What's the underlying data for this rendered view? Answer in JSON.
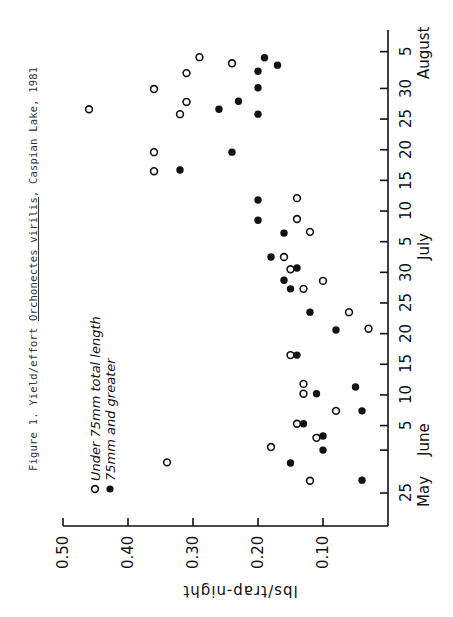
{
  "figure": {
    "title_prefix": "Figure 1.  Yield/effort ",
    "title_species": "Orchonectes virilis",
    "title_suffix": ", Caspian Lake, 1981"
  },
  "legend": {
    "open_label": "Under 75mm total length",
    "filled_label": "75mm and greater"
  },
  "axes": {
    "value_axis_title": "lbs/trap-night",
    "value_ticks": [
      "0.50",
      "0.40",
      "0.30",
      "0.20",
      "0.10"
    ],
    "date_tick_labels": [
      "25",
      "5",
      "10",
      "15",
      "20",
      "25",
      "30",
      "5",
      "10",
      "15",
      "20",
      "25",
      "30",
      "5"
    ],
    "month_labels": [
      "May",
      "June",
      "July",
      "August"
    ]
  },
  "chart_data": {
    "type": "scatter",
    "title": "Figure 1. Yield/effort Orchonectes virilis, Caspian Lake, 1981",
    "orientation": "rotated 90° counter-clockwise (date axis vertical on right, value axis horizontal at bottom)",
    "xlabel": "Date (May 25 – August 5, 1981)",
    "ylabel": "lbs/trap-night",
    "ylim": [
      0,
      0.5
    ],
    "y_ticks": [
      0.1,
      0.2,
      0.3,
      0.4,
      0.5
    ],
    "x_ticks": [
      "May 25",
      "Jun 1",
      "Jun 5",
      "Jun 10",
      "Jun 15",
      "Jun 20",
      "Jun 25",
      "Jun 30",
      "Jul 5",
      "Jul 10",
      "Jul 15",
      "Jul 20",
      "Jul 25",
      "Jul 30",
      "Aug 5"
    ],
    "grid": false,
    "legend_position": "upper-left (rotated)",
    "series": [
      {
        "name": "Under 75mm total length",
        "marker": "open-circle",
        "points": [
          {
            "date": "May 27",
            "day": 2,
            "value": 0.12
          },
          {
            "date": "May 30",
            "day": 5,
            "value": 0.34
          },
          {
            "date": "Jun 1",
            "day": 7.5,
            "value": 0.18
          },
          {
            "date": "Jun 3",
            "day": 9,
            "value": 0.11
          },
          {
            "date": "Jun 5",
            "day": 11.3,
            "value": 0.14
          },
          {
            "date": "Jun 8",
            "day": 13.4,
            "value": 0.08
          },
          {
            "date": "Jun 11",
            "day": 16.2,
            "value": 0.13
          },
          {
            "date": "Jun 12",
            "day": 17.8,
            "value": 0.13
          },
          {
            "date": "Jun 17",
            "day": 22.5,
            "value": 0.15
          },
          {
            "date": "Jun 21",
            "day": 26.8,
            "value": 0.03
          },
          {
            "date": "Jun 24",
            "day": 29.5,
            "value": 0.06
          },
          {
            "date": "Jun 28",
            "day": 33.3,
            "value": 0.13
          },
          {
            "date": "Jun 29",
            "day": 34.6,
            "value": 0.1
          },
          {
            "date": "Jul 1",
            "day": 36.5,
            "value": 0.15
          },
          {
            "date": "Jul 3",
            "day": 38.5,
            "value": 0.16
          },
          {
            "date": "Jul 7",
            "day": 42.6,
            "value": 0.12
          },
          {
            "date": "Jul 9",
            "day": 44.7,
            "value": 0.14
          },
          {
            "date": "Jul 12",
            "day": 48.1,
            "value": 0.14
          },
          {
            "date": "Jul 17",
            "day": 52.5,
            "value": 0.36
          },
          {
            "date": "Jul 20",
            "day": 55.6,
            "value": 0.36
          },
          {
            "date": "Jul 26",
            "day": 61.8,
            "value": 0.32
          },
          {
            "date": "Jul 27",
            "day": 62.6,
            "value": 0.46
          },
          {
            "date": "Jul 28",
            "day": 63.8,
            "value": 0.31
          },
          {
            "date": "Jul 30",
            "day": 65.9,
            "value": 0.36
          },
          {
            "date": "Aug 1",
            "day": 68.5,
            "value": 0.31
          },
          {
            "date": "Aug 3",
            "day": 70.1,
            "value": 0.24
          },
          {
            "date": "Aug 4",
            "day": 71.1,
            "value": 0.29
          }
        ]
      },
      {
        "name": "75mm and greater",
        "marker": "filled-circle",
        "points": [
          {
            "date": "May 27",
            "day": 2.1,
            "value": 0.04
          },
          {
            "date": "May 30",
            "day": 4.9,
            "value": 0.15
          },
          {
            "date": "Jun 1",
            "day": 7,
            "value": 0.1
          },
          {
            "date": "Jun 3",
            "day": 9.3,
            "value": 0.1
          },
          {
            "date": "Jun 5",
            "day": 11.3,
            "value": 0.13
          },
          {
            "date": "Jun 8",
            "day": 13.4,
            "value": 0.04
          },
          {
            "date": "Jun 11",
            "day": 16.2,
            "value": 0.11
          },
          {
            "date": "Jun 12",
            "day": 17.3,
            "value": 0.05
          },
          {
            "date": "Jun 17",
            "day": 22.5,
            "value": 0.14
          },
          {
            "date": "Jun 21",
            "day": 26.6,
            "value": 0.08
          },
          {
            "date": "Jun 24",
            "day": 29.5,
            "value": 0.12
          },
          {
            "date": "Jun 28",
            "day": 33.3,
            "value": 0.15
          },
          {
            "date": "Jun 29",
            "day": 34.7,
            "value": 0.16
          },
          {
            "date": "Jul 1",
            "day": 36.7,
            "value": 0.14
          },
          {
            "date": "Jul 3",
            "day": 38.5,
            "value": 0.18
          },
          {
            "date": "Jul 7",
            "day": 42.4,
            "value": 0.16
          },
          {
            "date": "Jul 9",
            "day": 44.5,
            "value": 0.2
          },
          {
            "date": "Jul 12",
            "day": 47.8,
            "value": 0.2
          },
          {
            "date": "Jul 17",
            "day": 52.7,
            "value": 0.32
          },
          {
            "date": "Jul 20",
            "day": 55.6,
            "value": 0.24
          },
          {
            "date": "Jul 26",
            "day": 61.8,
            "value": 0.2
          },
          {
            "date": "Jul 27",
            "day": 62.6,
            "value": 0.26
          },
          {
            "date": "Jul 28",
            "day": 63.9,
            "value": 0.23
          },
          {
            "date": "Jul 30",
            "day": 66.1,
            "value": 0.2
          },
          {
            "date": "Aug 2",
            "day": 68.8,
            "value": 0.2
          },
          {
            "date": "Aug 3",
            "day": 69.8,
            "value": 0.17
          },
          {
            "date": "Aug 4",
            "day": 71,
            "value": 0.19
          }
        ]
      }
    ]
  },
  "layout": {
    "zero_x": 388,
    "px_per_unit": 650,
    "day0_y": 493,
    "px_per_day": 6.13,
    "value_axis_y": 526,
    "date_axis_x": 388,
    "date_axis_top": 30,
    "date_tick_days": [
      0,
      7,
      11,
      16,
      21,
      26,
      31,
      36,
      41,
      46,
      51,
      56,
      61,
      66,
      72
    ],
    "date_label_index": [
      0,
      null,
      1,
      2,
      3,
      4,
      5,
      6,
      7,
      8,
      9,
      10,
      11,
      12,
      13
    ],
    "month_label_days": [
      0,
      9,
      41,
      72
    ],
    "ink": "#111111"
  }
}
